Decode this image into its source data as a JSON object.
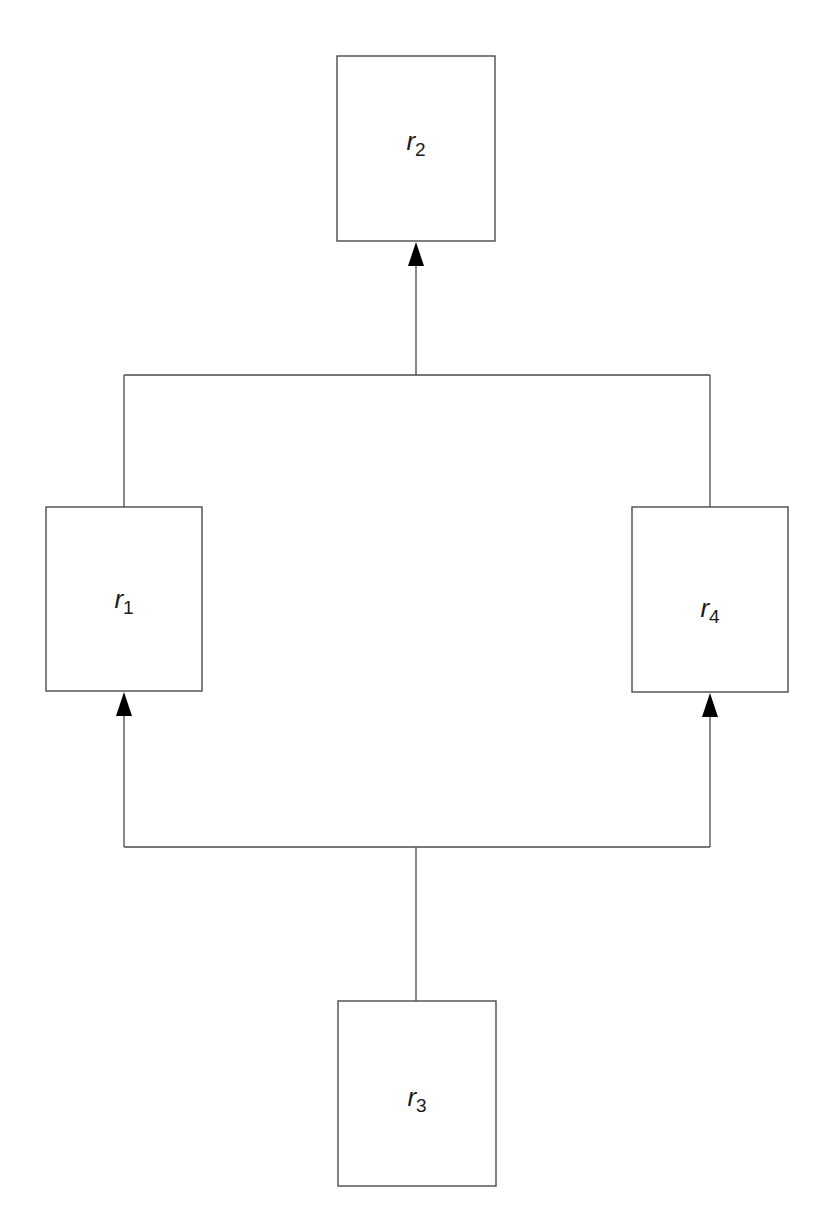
{
  "diagram": {
    "type": "flow-diagram",
    "colors": {
      "background": "#ffffff",
      "stroke": "#4a4a4a",
      "arrowhead": "#000000",
      "text": "#1a1a1a"
    },
    "nodes": [
      {
        "id": "r2",
        "variable": "r",
        "subscript": "2",
        "x": 337,
        "y": 56,
        "w": 158,
        "h": 185
      },
      {
        "id": "r1",
        "variable": "r",
        "subscript": "1",
        "x": 46,
        "y": 507,
        "w": 156,
        "h": 184
      },
      {
        "id": "r4",
        "variable": "r",
        "subscript": "4",
        "x": 632,
        "y": 507,
        "w": 156,
        "h": 185
      },
      {
        "id": "r3",
        "variable": "r",
        "subscript": "3",
        "x": 338,
        "y": 1001,
        "w": 158,
        "h": 185
      }
    ],
    "edges": [
      {
        "from": "r1",
        "to": "r2",
        "arrow": "end"
      },
      {
        "from": "r4",
        "to": "r2",
        "arrow": "end"
      },
      {
        "from": "r3",
        "to": "r1",
        "arrow": "end"
      },
      {
        "from": "r3",
        "to": "r4",
        "arrow": "end"
      }
    ]
  }
}
